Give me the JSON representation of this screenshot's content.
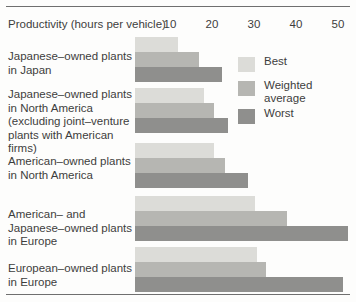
{
  "chart_data": {
    "type": "bar",
    "title": "",
    "subtitle": "",
    "orientation": "horizontal",
    "grouped": true,
    "xlabel": "Productivity (hours per vehicle)",
    "ylabel": "",
    "xlim": [
      0,
      53
    ],
    "grid": false,
    "legend_position": "top-right",
    "x_ticks": [
      10,
      20,
      30,
      40,
      50
    ],
    "x_tick_labels": [
      "10",
      "20",
      "30",
      "40",
      "50"
    ],
    "categories": [
      "Japanese–owned plants\nin Japan",
      "Japanese–owned plants\nin North America\n(excluding joint–venture\nplants with American\nfirms)",
      "American–owned plants\nin North America",
      "American– and\nJapanese–owned plants\nin Europe",
      "European–owned plants\nin Europe"
    ],
    "series": [
      {
        "name": "Best",
        "color": "#dcdcd8",
        "values": [
          10.2,
          16.4,
          18.8,
          28.6,
          29.0
        ]
      },
      {
        "name": "Weighted\naverage",
        "color": "#b6b6b2",
        "values": [
          15.2,
          18.8,
          21.4,
          36.2,
          31.2
        ]
      },
      {
        "name": "Worst",
        "color": "#8f8f8d",
        "values": [
          20.7,
          22.1,
          26.9,
          50.7,
          49.5
        ]
      }
    ]
  },
  "axis": {
    "title": "Productivity (hours per vehicle)",
    "ticks": [
      "10",
      "20",
      "30",
      "40",
      "50"
    ]
  },
  "legend": {
    "items": [
      {
        "label": "Best"
      },
      {
        "label": "Weighted\naverage"
      },
      {
        "label": "Worst"
      }
    ]
  },
  "groups": [
    {
      "label": "Japanese–owned plants\nin Japan",
      "bars": [
        {
          "series": "Best",
          "value": 10.2
        },
        {
          "series": "Weighted",
          "value": 15.2
        },
        {
          "series": "Worst",
          "value": 20.7
        }
      ]
    },
    {
      "label": "Japanese–owned plants\nin North America\n(excluding joint–venture\nplants with American\nfirms)",
      "bars": [
        {
          "series": "Best",
          "value": 16.4
        },
        {
          "series": "Weighted",
          "value": 18.8
        },
        {
          "series": "Worst",
          "value": 22.1
        }
      ]
    },
    {
      "label": "American–owned plants\nin North America",
      "bars": [
        {
          "series": "Best",
          "value": 18.8
        },
        {
          "series": "Weighted",
          "value": 21.4
        },
        {
          "series": "Worst",
          "value": 26.9
        }
      ]
    },
    {
      "label": "American– and\nJapanese–owned plants\nin Europe",
      "bars": [
        {
          "series": "Best",
          "value": 28.6
        },
        {
          "series": "Weighted",
          "value": 36.2
        },
        {
          "series": "Worst",
          "value": 50.7
        }
      ]
    },
    {
      "label": "European–owned plants\nin Europe",
      "bars": [
        {
          "series": "Best",
          "value": 29.0
        },
        {
          "series": "Weighted",
          "value": 31.2
        },
        {
          "series": "Worst",
          "value": 49.5
        }
      ]
    }
  ]
}
